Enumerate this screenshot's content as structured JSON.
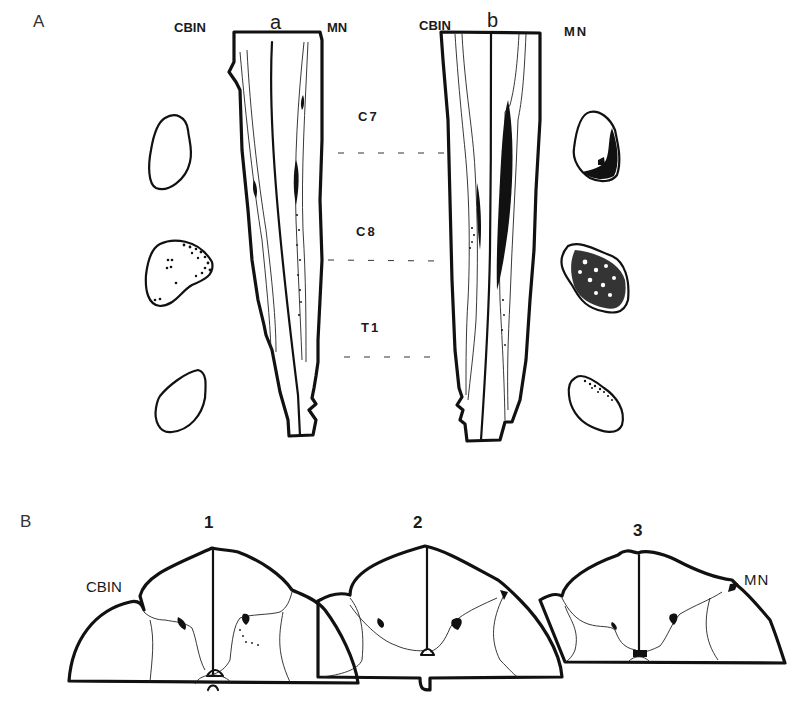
{
  "figure": {
    "panel_A": {
      "letter": "A",
      "preparation_a": {
        "letter": "a",
        "left_label": "CBIN",
        "right_label": "MN"
      },
      "preparation_b": {
        "letter": "b",
        "left_label": "CBIN",
        "right_label": "MN"
      },
      "segments": [
        "C7",
        "C8",
        "T1"
      ]
    },
    "panel_B": {
      "letter": "B",
      "sections": [
        {
          "number": "1",
          "label": "CBIN"
        },
        {
          "number": "2"
        },
        {
          "number": "3",
          "label": "MN"
        }
      ]
    }
  }
}
